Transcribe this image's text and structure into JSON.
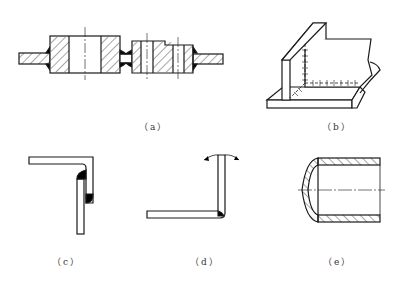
{
  "figure": {
    "type": "welded joint types technical drawing",
    "line_color": "#1a1a1a",
    "weld_fill": "#000000",
    "background": "#ffffff",
    "subfigures": [
      {
        "id": "a",
        "label": "（a）",
        "description": "flange/hub butt welds in section with hatching and centerlines"
      },
      {
        "id": "b",
        "label": "（b）",
        "description": "T-joint and corner fillet welds on perpendicular plates (isometric)"
      },
      {
        "id": "c",
        "label": "（c）",
        "description": "lap/edge joint of bent plate with fillet welds"
      },
      {
        "id": "d",
        "label": "（d）",
        "description": "corner joint with bending load arrows"
      },
      {
        "id": "e",
        "label": "（e）",
        "description": "end cap welded to pipe, sectional view"
      }
    ]
  }
}
